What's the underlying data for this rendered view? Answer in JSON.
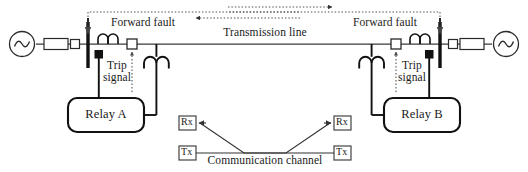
{
  "diagram": {
    "title_text": "Transmission line protection scheme with communication channel",
    "type": "single-line-power-system-protection-diagram",
    "colors": {
      "line": "#3a3a3a",
      "heavy": "#111111",
      "text": "#1a1a1a",
      "dotted": "#555555",
      "background": "#ffffff"
    },
    "labels": {
      "transmission_line": "Transmission line",
      "forward_fault_left": "Forward fault",
      "forward_fault_right": "Forward fault",
      "trip_signal_left_line1": "Trip",
      "trip_signal_left_line2": "signal",
      "trip_signal_right_line1": "Trip",
      "trip_signal_right_line2": "signal",
      "relay_a": "Relay A",
      "relay_b": "Relay B",
      "communication_channel": "Communication channel",
      "rx_left": "Rx",
      "tx_left": "Tx",
      "rx_right": "Rx",
      "tx_right": "Tx"
    },
    "icons": {
      "source_left": "ac-source-icon",
      "source_right": "ac-source-icon",
      "transformer_left": "transformer-block-icon",
      "transformer_right": "transformer-block-icon",
      "breaker_source_left": "circuit-breaker-icon",
      "breaker_source_right": "circuit-breaker-icon",
      "busbar_left": "busbar-icon",
      "busbar_right": "busbar-icon",
      "ct_left": "current-transformer-icon",
      "ct_right": "current-transformer-icon",
      "ct_tap_left": "ct-tap-icon",
      "ct_tap_right": "ct-tap-icon",
      "breaker_line_left": "circuit-breaker-icon",
      "breaker_line_right": "circuit-breaker-icon",
      "vt_left": "voltage-transformer-icon",
      "vt_right": "voltage-transformer-icon",
      "arrow_fault_left": "left-arrow-icon",
      "arrow_fault_right": "right-arrow-icon",
      "arrow_trip_left": "up-arrow-icon",
      "arrow_trip_right": "up-arrow-icon",
      "arrow_rx_left": "left-arrow-icon",
      "arrow_rx_right": "right-arrow-icon"
    }
  }
}
